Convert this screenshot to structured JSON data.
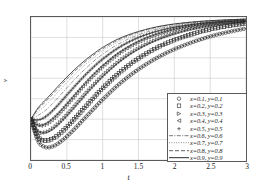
{
  "chart_data": {
    "type": "line",
    "title": "",
    "xlabel": "t",
    "ylabel": "v",
    "xlim": [
      0,
      3
    ],
    "ylim": [
      0.3,
      1
    ],
    "grid": true,
    "legend_position": "lower-right",
    "xticks": [
      "0",
      "0.5",
      "1",
      "1.5",
      "2",
      "2.5",
      "3"
    ],
    "xtick_values": [
      0,
      0.5,
      1,
      1.5,
      2,
      2.5,
      3
    ],
    "yticks": [
      "0.3",
      "0.4",
      "0.5",
      "0.6",
      "0.7",
      "0.8",
      "0.9",
      "1"
    ],
    "ytick_values": [
      0.3,
      0.4,
      0.5,
      0.6,
      0.7,
      0.8,
      0.9,
      1
    ],
    "x": [
      0,
      0.1,
      0.2,
      0.3,
      0.4,
      0.5,
      0.6,
      0.7,
      0.8,
      0.9,
      1.0,
      1.2,
      1.4,
      1.6,
      1.8,
      2.0,
      2.2,
      2.4,
      2.6,
      2.8,
      3.0
    ],
    "series": [
      {
        "name": "x=0.1, y=0.1",
        "marker": "circle",
        "linestyle": "solid",
        "color": "#262626",
        "values": [
          0.5,
          0.392,
          0.363,
          0.366,
          0.386,
          0.415,
          0.449,
          0.486,
          0.523,
          0.56,
          0.596,
          0.662,
          0.719,
          0.767,
          0.808,
          0.842,
          0.87,
          0.894,
          0.914,
          0.93,
          0.944
        ]
      },
      {
        "name": "x=0.2, y=0.2",
        "marker": "square",
        "linestyle": "solid",
        "color": "#262626",
        "values": [
          0.5,
          0.413,
          0.395,
          0.404,
          0.428,
          0.461,
          0.498,
          0.537,
          0.576,
          0.614,
          0.651,
          0.717,
          0.773,
          0.819,
          0.857,
          0.887,
          0.911,
          0.931,
          0.947,
          0.959,
          0.969
        ]
      },
      {
        "name": "x=0.3, y=0.3",
        "marker": "right-triangle",
        "linestyle": "solid",
        "color": "#262626",
        "values": [
          0.5,
          0.441,
          0.435,
          0.452,
          0.482,
          0.518,
          0.557,
          0.597,
          0.637,
          0.674,
          0.71,
          0.773,
          0.824,
          0.864,
          0.895,
          0.919,
          0.938,
          0.952,
          0.963,
          0.971,
          0.977
        ]
      },
      {
        "name": "x=0.4, y=0.4",
        "marker": "left-triangle",
        "linestyle": "solid",
        "color": "#262626",
        "values": [
          0.5,
          0.47,
          0.475,
          0.5,
          0.534,
          0.573,
          0.613,
          0.653,
          0.691,
          0.727,
          0.76,
          0.817,
          0.861,
          0.895,
          0.92,
          0.939,
          0.953,
          0.964,
          0.972,
          0.978,
          0.982
        ]
      },
      {
        "name": "x=0.5, y=0.5",
        "marker": "plus",
        "linestyle": "solid",
        "color": "#262626",
        "values": [
          0.5,
          0.496,
          0.511,
          0.541,
          0.578,
          0.618,
          0.657,
          0.695,
          0.731,
          0.764,
          0.794,
          0.845,
          0.884,
          0.913,
          0.934,
          0.95,
          0.961,
          0.97,
          0.976,
          0.981,
          0.984
        ]
      },
      {
        "name": "x=0.6, y=0.6",
        "marker": "none",
        "linestyle": "dashdot",
        "color": "#555555",
        "values": [
          0.5,
          0.519,
          0.542,
          0.576,
          0.614,
          0.653,
          0.691,
          0.727,
          0.76,
          0.791,
          0.818,
          0.864,
          0.899,
          0.925,
          0.944,
          0.957,
          0.967,
          0.974,
          0.979,
          0.983,
          0.986
        ]
      },
      {
        "name": "x=0.7, y=0.7",
        "marker": "none",
        "linestyle": "dotted",
        "color": "#666666",
        "values": [
          0.5,
          0.537,
          0.567,
          0.603,
          0.641,
          0.679,
          0.715,
          0.749,
          0.78,
          0.808,
          0.834,
          0.876,
          0.908,
          0.932,
          0.949,
          0.962,
          0.971,
          0.977,
          0.982,
          0.985,
          0.988
        ]
      },
      {
        "name": "x=0.8, y=0.8",
        "marker": "none",
        "linestyle": "dashed",
        "color": "#3a3a3a",
        "values": [
          0.5,
          0.549,
          0.584,
          0.621,
          0.659,
          0.696,
          0.731,
          0.763,
          0.793,
          0.82,
          0.844,
          0.884,
          0.914,
          0.937,
          0.953,
          0.965,
          0.973,
          0.979,
          0.983,
          0.987,
          0.989
        ]
      },
      {
        "name": "x=0.9, y=0.9",
        "marker": "none",
        "linestyle": "solid",
        "color": "#2b2b2b",
        "values": [
          0.5,
          0.556,
          0.593,
          0.631,
          0.669,
          0.706,
          0.74,
          0.772,
          0.801,
          0.827,
          0.851,
          0.89,
          0.918,
          0.939,
          0.955,
          0.966,
          0.974,
          0.98,
          0.984,
          0.987,
          0.99
        ]
      }
    ]
  },
  "legend": {
    "entries": [
      "x=0.1, y=0.1",
      "x=0.2, y=0.2",
      "x=0.3, y=0.3",
      "x=0.4, y=0.4",
      "x=0.5, y=0.5",
      "x=0.6, y=0.6",
      "x=0.7, y=0.7",
      "x=0.8, y=0.8",
      "x=0.9, y=0.9"
    ]
  },
  "style": {
    "grid_color": "#c8c8c8",
    "axis_color": "#5a5a5a",
    "background": "#ffffff",
    "text_color": "#1a1a1a"
  }
}
